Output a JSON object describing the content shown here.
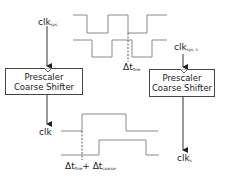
{
  "diagram": {
    "type": "timing-diagram",
    "left_block": {
      "input_label": "clk",
      "input_subscript": "sys",
      "box_line1": "Prescaler",
      "box_line2": "Coarse Shifter",
      "output_label": "clk",
      "output_subscript": ""
    },
    "right_block": {
      "input_label": "clk",
      "input_subscript": "sys, s",
      "box_line1": "Prescaler",
      "box_line2": "Coarse Shifter",
      "output_label": "clk",
      "output_subscript": "s"
    },
    "top_waveforms": {
      "delay_label": "Δt",
      "delay_subscript": "fine"
    },
    "bottom_waveforms": {
      "delay_label_1": "Δt",
      "delay_subscript_1": "fine",
      "plus": "+",
      "delay_label_2": "Δt",
      "delay_subscript_2": "coarse"
    },
    "colors": {
      "waveform": "#8a8a8a",
      "arrow": "#333333",
      "box_border": "#444444"
    }
  }
}
